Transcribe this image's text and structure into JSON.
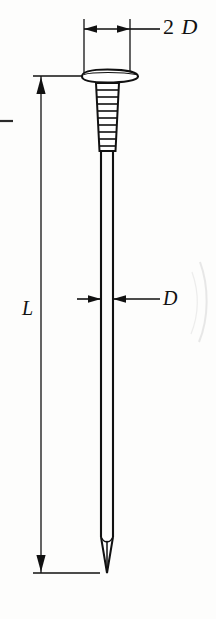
{
  "figure": {
    "object_name": "nail",
    "stroke_color": "#111111",
    "background_color": "#fdfdfc",
    "annotations": [
      {
        "id": "head-diameter",
        "text_prefix": "2",
        "text_symbol": "D",
        "full_text": "2 D",
        "meaning": "head diameter",
        "dimension_type": "linear-horizontal",
        "position": "top"
      },
      {
        "id": "nail-length",
        "full_text": "L",
        "meaning": "overall nail length",
        "dimension_type": "linear-vertical",
        "position": "left"
      },
      {
        "id": "shank-diameter",
        "full_text": "D",
        "meaning": "shank diameter",
        "dimension_type": "linear-horizontal",
        "position": "middle-right"
      }
    ]
  },
  "labels": {
    "head_diameter_number": "2",
    "head_diameter_symbol": "D",
    "length_symbol": "L",
    "shank_diameter_symbol": "D"
  },
  "geometry": {
    "head_left_x": 82,
    "head_right_x": 138,
    "head_top_y": 70,
    "head_bottom_y": 82,
    "shank_left_x": 101,
    "shank_right_x": 113,
    "knurl_top_y": 84,
    "knurl_bottom_y": 150,
    "knurl_rib_count": 9,
    "tip_start_y": 534,
    "tip_point_y": 573,
    "dim_line_2d_y": 29,
    "dim_line_l_x": 41,
    "dim_line_d_y": 299
  }
}
